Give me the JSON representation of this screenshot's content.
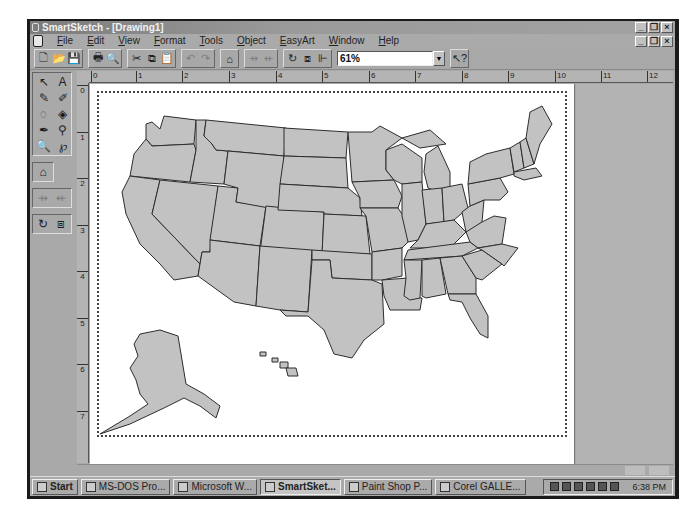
{
  "window": {
    "title": "SmartSketch - [Drawing1]",
    "controls": [
      "minimize",
      "restore",
      "close"
    ]
  },
  "menubar": {
    "items": [
      {
        "label": "File"
      },
      {
        "label": "Edit"
      },
      {
        "label": "View"
      },
      {
        "label": "Format"
      },
      {
        "label": "Tools"
      },
      {
        "label": "Object"
      },
      {
        "label": "EasyArt"
      },
      {
        "label": "Window"
      },
      {
        "label": "Help"
      }
    ]
  },
  "toolbar": {
    "groups": [
      [
        {
          "icon": "new-document-icon",
          "glyph": "🗋"
        },
        {
          "icon": "open-folder-icon",
          "glyph": "📂"
        },
        {
          "icon": "save-icon",
          "glyph": "💾"
        }
      ],
      [
        {
          "icon": "print-icon",
          "glyph": "🖶"
        },
        {
          "icon": "print-preview-icon",
          "glyph": "🔍"
        }
      ],
      [
        {
          "icon": "cut-icon",
          "glyph": "✂"
        },
        {
          "icon": "copy-icon",
          "glyph": "⧉"
        },
        {
          "icon": "paste-icon",
          "glyph": "📋"
        }
      ],
      [
        {
          "icon": "undo-icon",
          "glyph": "↶",
          "disabled": true
        },
        {
          "icon": "redo-icon",
          "glyph": "↷",
          "disabled": true
        }
      ],
      [
        {
          "icon": "easyart-gallery-icon",
          "glyph": "⌂"
        }
      ],
      [
        {
          "icon": "group-icon",
          "glyph": "⇸",
          "disabled": true
        },
        {
          "icon": "ungroup-icon",
          "glyph": "⇷",
          "disabled": true
        }
      ],
      [
        {
          "icon": "rotate-icon",
          "glyph": "↻"
        },
        {
          "icon": "bring-forward-icon",
          "glyph": "⧈"
        },
        {
          "icon": "align-icon",
          "glyph": "⊩"
        }
      ]
    ],
    "zoom_value": "61%",
    "help_icon": "context-help-icon"
  },
  "left_tools": {
    "drawing_tools": [
      {
        "name": "select-arrow-icon",
        "glyph": "↖"
      },
      {
        "name": "text-tool-icon",
        "glyph": "A"
      },
      {
        "name": "pencil-tool-icon",
        "glyph": "✎"
      },
      {
        "name": "brush-tool-icon",
        "glyph": "✐"
      },
      {
        "name": "lasso-tool-icon",
        "glyph": "◌"
      },
      {
        "name": "fill-bucket-icon",
        "glyph": "◈"
      },
      {
        "name": "pen-tool-icon",
        "glyph": "✒"
      },
      {
        "name": "eyedropper-icon",
        "glyph": "⚲"
      },
      {
        "name": "zoom-tool-icon",
        "glyph": "🔍"
      },
      {
        "name": "freeform-shape-icon",
        "glyph": "℘"
      }
    ],
    "gallery_tool": {
      "name": "easyart-gallery-icon",
      "glyph": "⌂"
    },
    "group_tools": [
      {
        "name": "group-icon",
        "glyph": "⇸",
        "disabled": true
      },
      {
        "name": "ungroup-icon",
        "glyph": "⇷",
        "disabled": true
      }
    ],
    "transform_tools": [
      {
        "name": "rotate-icon",
        "glyph": "↻"
      },
      {
        "name": "bring-forward-icon",
        "glyph": "⧈"
      }
    ]
  },
  "ruler": {
    "horizontal_labels": [
      "0",
      "1",
      "2",
      "3",
      "4",
      "5",
      "6",
      "7",
      "8",
      "9",
      "10",
      "11",
      "12"
    ],
    "vertical_labels": [
      "0",
      "1",
      "2",
      "3",
      "4",
      "5",
      "6",
      "7"
    ]
  },
  "canvas": {
    "content": "Map of the United States with state outlines, Alaska and Hawaii insets"
  },
  "taskbar": {
    "start_label": "Start",
    "tasks": [
      {
        "label": "MS-DOS Pro...",
        "active": false
      },
      {
        "label": "Microsoft W...",
        "active": false
      },
      {
        "label": "SmartSket...",
        "active": true
      },
      {
        "label": "Paint Shop P...",
        "active": false
      },
      {
        "label": "Corel GALLE...",
        "active": false
      }
    ],
    "clock": "6:38 PM"
  }
}
